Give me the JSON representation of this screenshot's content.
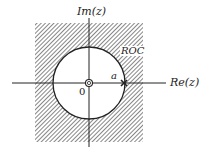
{
  "diagram": {
    "axes": {
      "x_label": "Re(z)",
      "y_label": "Im(z)"
    },
    "origin_label": "0",
    "circle_label": "a",
    "region_label": "ROC",
    "pole_marker": "pole at z=a",
    "zero_marker": "zero at origin",
    "colors": {
      "ink": "#222222",
      "background": "#ffffff"
    }
  }
}
